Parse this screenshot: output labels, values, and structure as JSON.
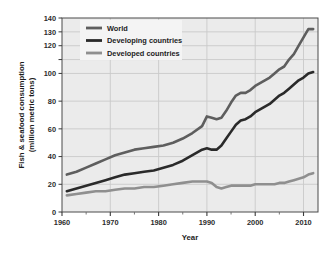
{
  "chart_data": {
    "type": "line",
    "title": "",
    "xlabel": "Year",
    "ylabel": "Fish & seafood consumption\n(million metric tons)",
    "ylabel_line1": "Fish & seafood consumption",
    "ylabel_line2": "(million metric tons)",
    "xlim": [
      1960,
      2013
    ],
    "ylim": [
      0,
      140
    ],
    "grid": true,
    "legend_position": "top-left",
    "background_color": "#ebebeb",
    "gridline_color": "#c9c9c9",
    "x_ticks_major": [
      1960,
      1970,
      1980,
      1990,
      2000,
      2010
    ],
    "x_tick_labels": [
      "1960",
      "1970",
      "1980",
      "1990",
      "2000",
      "2010"
    ],
    "x_ticks_minor": [
      1965,
      1975,
      1985,
      1995,
      2005
    ],
    "y_ticks": [
      0,
      20,
      40,
      60,
      80,
      100,
      110,
      120,
      130,
      140
    ],
    "y_tick_labels": [
      "0",
      "20",
      "40",
      "60",
      "80",
      "100",
      "",
      "120",
      "130",
      "140"
    ],
    "series": [
      {
        "name": "World",
        "color": "#5e5e5e",
        "x": [
          1961,
          1963,
          1965,
          1967,
          1969,
          1971,
          1973,
          1975,
          1977,
          1979,
          1981,
          1983,
          1985,
          1987,
          1989,
          1990,
          1991,
          1992,
          1993,
          1994,
          1995,
          1996,
          1997,
          1998,
          1999,
          2000,
          2001,
          2002,
          2003,
          2004,
          2005,
          2006,
          2007,
          2008,
          2009,
          2010,
          2011,
          2012
        ],
        "values": [
          27,
          29,
          32,
          35,
          38,
          41,
          43,
          45,
          46,
          47,
          48,
          50,
          53,
          57,
          62,
          69,
          68,
          67,
          68,
          73,
          79,
          84,
          86,
          86,
          88,
          91,
          93,
          95,
          97,
          100,
          103,
          105,
          110,
          114,
          120,
          126,
          132,
          132
        ]
      },
      {
        "name": "Developing countries",
        "color": "#2a2a2a",
        "x": [
          1961,
          1963,
          1965,
          1967,
          1969,
          1971,
          1973,
          1975,
          1977,
          1979,
          1981,
          1983,
          1985,
          1987,
          1989,
          1990,
          1991,
          1992,
          1993,
          1994,
          1995,
          1996,
          1997,
          1998,
          1999,
          2000,
          2001,
          2002,
          2003,
          2004,
          2005,
          2006,
          2007,
          2008,
          2009,
          2010,
          2011,
          2012
        ],
        "values": [
          15,
          17,
          19,
          21,
          23,
          25,
          27,
          28,
          29,
          30,
          32,
          34,
          37,
          41,
          45,
          46,
          45,
          45,
          48,
          53,
          58,
          63,
          66,
          67,
          69,
          72,
          74,
          76,
          78,
          81,
          84,
          86,
          89,
          92,
          95,
          97,
          100,
          101
        ]
      },
      {
        "name": "Developed countries",
        "color": "#8f8f8f",
        "x": [
          1961,
          1963,
          1965,
          1967,
          1969,
          1971,
          1973,
          1975,
          1977,
          1979,
          1981,
          1983,
          1985,
          1987,
          1989,
          1990,
          1991,
          1992,
          1993,
          1994,
          1995,
          1996,
          1997,
          1998,
          1999,
          2000,
          2001,
          2002,
          2003,
          2004,
          2005,
          2006,
          2007,
          2008,
          2009,
          2010,
          2011,
          2012
        ],
        "values": [
          12,
          13,
          14,
          15,
          15,
          16,
          17,
          17,
          18,
          18,
          19,
          20,
          21,
          22,
          22,
          22,
          21,
          18,
          17,
          18,
          19,
          19,
          19,
          19,
          19,
          20,
          20,
          20,
          20,
          20,
          21,
          21,
          22,
          23,
          24,
          25,
          27,
          28
        ]
      }
    ]
  },
  "legend": {
    "items": [
      {
        "label": "World",
        "color": "#5e5e5e"
      },
      {
        "label": "Developing countries",
        "color": "#2a2a2a"
      },
      {
        "label": "Developed countries",
        "color": "#8f8f8f"
      }
    ]
  },
  "axes": {
    "x_title": "Year",
    "y_title_line1": "Fish & seafood consumption",
    "y_title_line2": "(million metric tons)"
  }
}
